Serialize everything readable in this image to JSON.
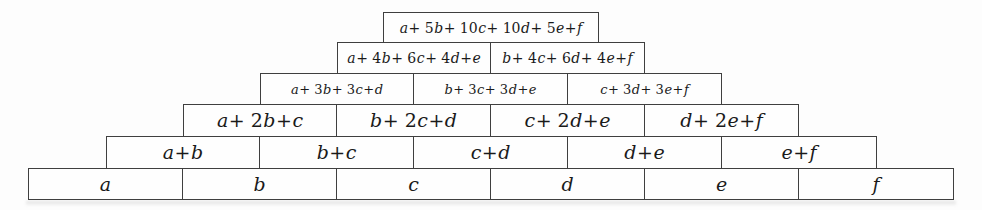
{
  "pyramid": {
    "rows": [
      {
        "cells": [
          "a + 5b + 10c + 10d + 5e + f"
        ]
      },
      {
        "cells": [
          "a + 4b + 6c + 4d + e",
          "b + 4c + 6d + 4e + f"
        ]
      },
      {
        "cells": [
          "a + 3b + 3c + d",
          "b + 3c + 3d + e",
          "c + 3d + 3e + f"
        ]
      },
      {
        "cells": [
          "a + 2b + c",
          "b + 2c + d",
          "c + 2d + e",
          "d + 2e + f"
        ]
      },
      {
        "cells": [
          "a + b",
          "b + c",
          "c + d",
          "d + e",
          "e + f"
        ]
      },
      {
        "cells": [
          "a",
          "b",
          "c",
          "d",
          "e",
          "f"
        ]
      }
    ],
    "colors": {
      "border": "#3f3f3f",
      "text": "#1a1a1a",
      "background": "#fdfdfd",
      "cell_background": "#fefefe"
    }
  }
}
